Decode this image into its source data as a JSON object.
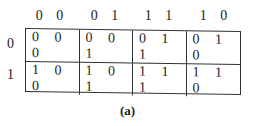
{
  "column_headers": [
    "0 0",
    "0 1",
    "1 1",
    "1 0"
  ],
  "row_headers": [
    "0",
    "1"
  ],
  "cells": [
    [
      "0 0 0",
      "0 0 1",
      "0 1 1",
      "0 1 0"
    ],
    [
      "1 0 0",
      "1 0 1",
      "1 1 1",
      "1 1 0"
    ]
  ],
  "caption": "(a)"
}
